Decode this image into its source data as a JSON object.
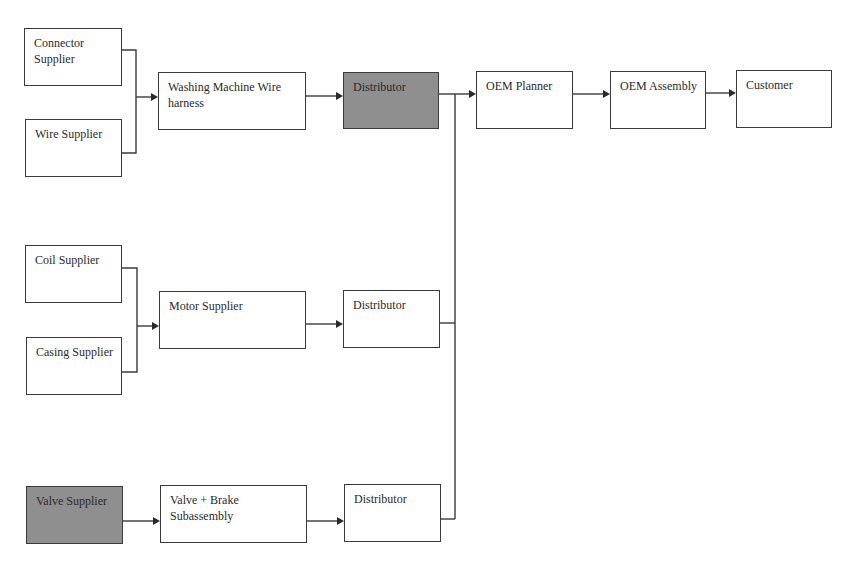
{
  "diagram": {
    "type": "supply-chain-flow",
    "nodes": {
      "connector_supplier": {
        "label": "Connector Supplier",
        "shaded": false
      },
      "wire_supplier": {
        "label": "Wire Supplier",
        "shaded": false
      },
      "wire_harness": {
        "label": "Washing Machine Wire harness",
        "shaded": false
      },
      "distributor_1": {
        "label": "Distributor",
        "shaded": true
      },
      "oem_planner": {
        "label": "OEM Planner",
        "shaded": false
      },
      "oem_assembly": {
        "label": "OEM Assembly",
        "shaded": false
      },
      "customer": {
        "label": "Customer",
        "shaded": false
      },
      "coil_supplier": {
        "label": "Coil Supplier",
        "shaded": false
      },
      "casing_supplier": {
        "label": "Casing Supplier",
        "shaded": false
      },
      "motor_supplier": {
        "label": "Motor Supplier",
        "shaded": false
      },
      "distributor_2": {
        "label": "Distributor",
        "shaded": false
      },
      "valve_supplier": {
        "label": "Valve Supplier",
        "shaded": true
      },
      "valve_brake_subassembly": {
        "label": "Valve + Brake Subassembly",
        "shaded": false
      },
      "distributor_3": {
        "label": "Distributor",
        "shaded": false
      }
    },
    "edges": [
      {
        "from": "connector_supplier",
        "to": "wire_harness"
      },
      {
        "from": "wire_supplier",
        "to": "wire_harness"
      },
      {
        "from": "wire_harness",
        "to": "distributor_1"
      },
      {
        "from": "distributor_1",
        "to": "oem_planner"
      },
      {
        "from": "oem_planner",
        "to": "oem_assembly"
      },
      {
        "from": "oem_assembly",
        "to": "customer"
      },
      {
        "from": "coil_supplier",
        "to": "motor_supplier"
      },
      {
        "from": "casing_supplier",
        "to": "motor_supplier"
      },
      {
        "from": "motor_supplier",
        "to": "distributor_2"
      },
      {
        "from": "distributor_2",
        "to": "oem_planner"
      },
      {
        "from": "valve_supplier",
        "to": "valve_brake_subassembly"
      },
      {
        "from": "valve_brake_subassembly",
        "to": "distributor_3"
      },
      {
        "from": "distributor_3",
        "to": "oem_planner"
      }
    ]
  }
}
